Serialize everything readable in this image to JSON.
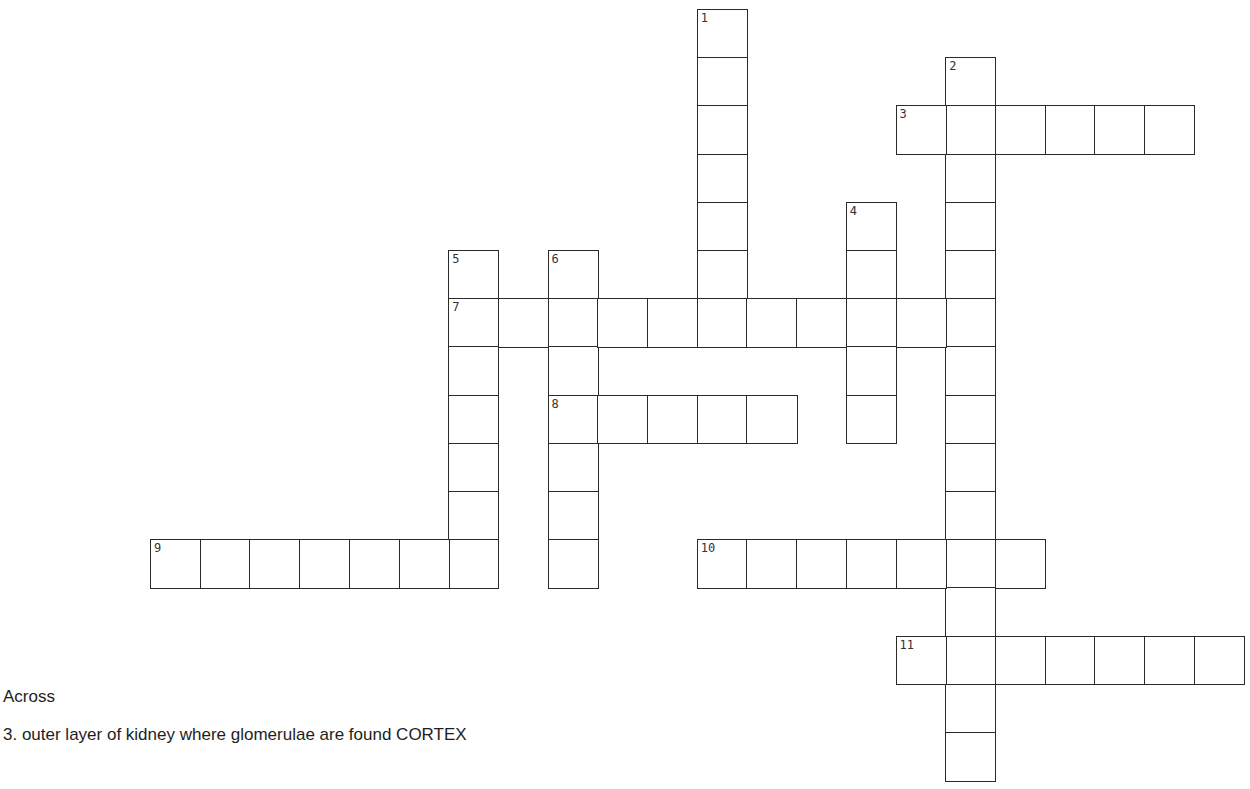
{
  "puzzle": {
    "words": [
      {
        "number": "1",
        "direction": "down",
        "row": 0,
        "col": 11,
        "length": 7
      },
      {
        "number": "2",
        "direction": "down",
        "row": 1,
        "col": 16,
        "length": 15
      },
      {
        "number": "3",
        "direction": "across",
        "row": 2,
        "col": 15,
        "length": 6
      },
      {
        "number": "4",
        "direction": "down",
        "row": 4,
        "col": 14,
        "length": 5
      },
      {
        "number": "5",
        "direction": "down",
        "row": 5,
        "col": 6,
        "length": 7
      },
      {
        "number": "6",
        "direction": "down",
        "row": 5,
        "col": 8,
        "length": 7
      },
      {
        "number": "7",
        "direction": "across",
        "row": 6,
        "col": 6,
        "length": 11
      },
      {
        "number": "8",
        "direction": "across",
        "row": 8,
        "col": 8,
        "length": 5
      },
      {
        "number": "9",
        "direction": "across",
        "row": 11,
        "col": 0,
        "length": 7
      },
      {
        "number": "10",
        "direction": "across",
        "row": 11,
        "col": 11,
        "length": 7
      },
      {
        "number": "11",
        "direction": "across",
        "row": 13,
        "col": 15,
        "length": 7
      }
    ]
  },
  "clues": {
    "across_heading": "Across",
    "across": [
      {
        "text": "3. outer layer of kidney where glomerulae are found  CORTEX"
      }
    ]
  }
}
